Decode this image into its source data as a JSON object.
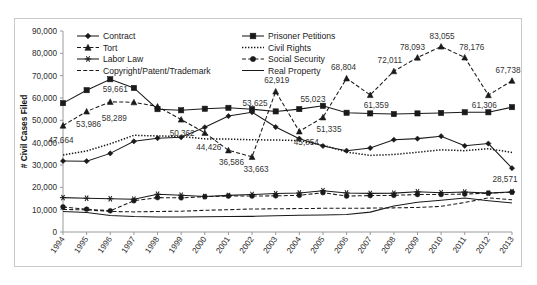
{
  "chart_data": {
    "type": "line",
    "title": "",
    "xlabel": "",
    "ylabel": "# Civil Cases Filed",
    "ylim": [
      0,
      90000
    ],
    "ytick_values": [
      0,
      10000,
      20000,
      30000,
      40000,
      50000,
      60000,
      70000,
      80000,
      90000
    ],
    "ytick_labels": [
      "0",
      "10,000",
      "20,000",
      "30,000",
      "40,000",
      "50,000",
      "60,000",
      "70,000",
      "80,000",
      "90,000"
    ],
    "grid": false,
    "legend_position": "top-inside",
    "categories": [
      "1994",
      "1995",
      "1996",
      "1997",
      "1998",
      "1999",
      "2000",
      "2001",
      "2002",
      "2003",
      "2004",
      "2005",
      "2006",
      "2007",
      "2008",
      "2009",
      "2010",
      "2011",
      "2012",
      "2013"
    ],
    "series": [
      {
        "name": "Contract",
        "line_style": "solid",
        "marker": "diamond",
        "values": [
          31800,
          31700,
          35200,
          40600,
          42000,
          42400,
          46900,
          51900,
          53625,
          47000,
          41800,
          38500,
          36400,
          37600,
          41300,
          41800,
          42900,
          38600,
          39600,
          28571
        ]
      },
      {
        "name": "Tort",
        "line_style": "dashed",
        "marker": "triangle",
        "values": [
          47664,
          53986,
          58289,
          58100,
          56200,
          50362,
          44426,
          36586,
          33663,
          62919,
          45054,
          51335,
          68804,
          61359,
          72011,
          78093,
          83055,
          78176,
          61306,
          67738
        ]
      },
      {
        "name": "Labor Law",
        "line_style": "solid",
        "marker": "asterisk",
        "values": [
          15400,
          15100,
          14900,
          14700,
          16900,
          16500,
          15900,
          16400,
          16800,
          17200,
          17500,
          18500,
          17500,
          17300,
          17400,
          18000,
          17600,
          17900,
          17400,
          18000
        ]
      },
      {
        "name": "Copyright/Patent/Trademark",
        "line_style": "dashed",
        "marker": "none",
        "values": [
          10100,
          9900,
          9200,
          9000,
          9200,
          9300,
          9700,
          10000,
          10300,
          10400,
          10500,
          10600,
          10600,
          10700,
          10800,
          11000,
          11500,
          13200,
          15300,
          14400
        ]
      },
      {
        "name": "Prisoner Petitions",
        "line_style": "solid",
        "marker": "square",
        "values": [
          57700,
          63500,
          68400,
          64500,
          55000,
          54500,
          55200,
          55600,
          55000,
          54000,
          55023,
          56500,
          53400,
          53100,
          52800,
          53100,
          53300,
          53600,
          53600,
          55900
        ]
      },
      {
        "name": "Civil Rights",
        "line_style": "dotted",
        "marker": "none",
        "values": [
          34500,
          36300,
          39500,
          43300,
          43000,
          42800,
          41700,
          41600,
          41300,
          41200,
          40900,
          38900,
          35800,
          34300,
          34700,
          35700,
          36800,
          36400,
          37300,
          35600
        ]
      },
      {
        "name": "Social Security",
        "line_style": "dashed",
        "marker": "circle",
        "values": [
          11200,
          10200,
          9500,
          14000,
          15400,
          15300,
          15800,
          16100,
          16100,
          16200,
          16400,
          17600,
          16100,
          16300,
          16400,
          16800,
          16800,
          17000,
          17400,
          17800
        ]
      },
      {
        "name": "Real Property",
        "line_style": "solid",
        "marker": "none",
        "values": [
          9200,
          8700,
          7400,
          6900,
          6700,
          6700,
          6800,
          6900,
          7000,
          7300,
          7500,
          7600,
          7800,
          8900,
          11600,
          13300,
          14200,
          15200,
          14000,
          13000
        ]
      }
    ],
    "annotations": [
      {
        "text": "47,664",
        "x_index": 0,
        "value": 47664,
        "dx": -2,
        "dy": 17
      },
      {
        "text": "53,986",
        "x_index": 1,
        "value": 53986,
        "dx": 2,
        "dy": 16
      },
      {
        "text": "58,289",
        "x_index": 2,
        "value": 58289,
        "dx": 4,
        "dy": 19
      },
      {
        "text": "59,661",
        "x_index": 2,
        "value": 59661,
        "dx": 5,
        "dy": -7
      },
      {
        "text": "50,362",
        "x_index": 5,
        "value": 50362,
        "dx": 1,
        "dy": 16
      },
      {
        "text": "44,426",
        "x_index": 6,
        "value": 44426,
        "dx": 4,
        "dy": 17
      },
      {
        "text": "36,586",
        "x_index": 7,
        "value": 36586,
        "dx": 3,
        "dy": 15
      },
      {
        "text": "33,663",
        "x_index": 8,
        "value": 33663,
        "dx": 4,
        "dy": 15
      },
      {
        "text": "53,625",
        "x_index": 8,
        "value": 53625,
        "dx": 3,
        "dy": -6
      },
      {
        "text": "62,919",
        "x_index": 9,
        "value": 62919,
        "dx": 1,
        "dy": -8
      },
      {
        "text": "45,054",
        "x_index": 10,
        "value": 45054,
        "dx": 7,
        "dy": 14
      },
      {
        "text": "51,335",
        "x_index": 11,
        "value": 51335,
        "dx": 6,
        "dy": 15
      },
      {
        "text": "55,023",
        "x_index": 11,
        "value": 55023,
        "dx": -10,
        "dy": -7
      },
      {
        "text": "68,804",
        "x_index": 12,
        "value": 68804,
        "dx": -3,
        "dy": -8
      },
      {
        "text": "61,359",
        "x_index": 13,
        "value": 61359,
        "dx": 6,
        "dy": 13
      },
      {
        "text": "72,011",
        "x_index": 14,
        "value": 72011,
        "dx": -4,
        "dy": -8
      },
      {
        "text": "78,093",
        "x_index": 15,
        "value": 78093,
        "dx": -5,
        "dy": -8
      },
      {
        "text": "83,055",
        "x_index": 16,
        "value": 83055,
        "dx": 1,
        "dy": -8
      },
      {
        "text": "78,176",
        "x_index": 17,
        "value": 78176,
        "dx": 7,
        "dy": -7
      },
      {
        "text": "61,306",
        "x_index": 18,
        "value": 61306,
        "dx": -4,
        "dy": 13
      },
      {
        "text": "67,738",
        "x_index": 19,
        "value": 67738,
        "dx": -4,
        "dy": -8
      },
      {
        "text": "28,571",
        "x_index": 19,
        "value": 28571,
        "dx": -7,
        "dy": 14
      }
    ]
  },
  "legend": {
    "column_left": [
      {
        "label": "Contract",
        "line_style": "solid",
        "marker": "diamond"
      },
      {
        "label": "Tort",
        "line_style": "dashed",
        "marker": "triangle"
      },
      {
        "label": "Labor Law",
        "line_style": "solid",
        "marker": "asterisk"
      },
      {
        "label": "Copyright/Patent/Trademark",
        "line_style": "dashed",
        "marker": "none"
      }
    ],
    "column_right": [
      {
        "label": "Prisoner Petitions",
        "line_style": "solid",
        "marker": "square"
      },
      {
        "label": "Civil Rights",
        "line_style": "dotted",
        "marker": "none"
      },
      {
        "label": "Social Security",
        "line_style": "dashed",
        "marker": "circle"
      },
      {
        "label": "Real Property",
        "line_style": "solid",
        "marker": "none"
      }
    ]
  },
  "colors": {
    "series": "#1a1a1a",
    "axis": "#9a9a9a",
    "frame": "#c9c9c9",
    "text": "#2b2b2b",
    "label_text": "#333333",
    "background": "#ffffff"
  }
}
